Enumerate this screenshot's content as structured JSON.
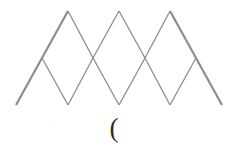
{
  "figure": {
    "name": "triangular-lattice-trapezoid",
    "caption_symbol": "(",
    "faint_artifact": "..",
    "canvas": {
      "width": 238,
      "height": 150,
      "background": "#ffffff"
    },
    "stroke": {
      "color": "#8d8d8d",
      "outline_width": 2.2,
      "inner_width": 1.3
    },
    "geometry": {
      "unit": 51,
      "row_height": 47,
      "rows": [
        {
          "name": "top-edge",
          "y": 11,
          "x_start": 68,
          "x_end": 170,
          "nodes": [
            68,
            119,
            170
          ]
        },
        {
          "name": "middle-edge",
          "y": 58,
          "x_start": 42,
          "x_end": 196,
          "nodes": [
            42,
            93,
            145,
            196
          ]
        },
        {
          "name": "bottom-edge",
          "y": 105,
          "x_start": 16,
          "x_end": 222,
          "nodes": [
            16,
            68,
            119,
            170,
            222
          ]
        }
      ]
    },
    "outline_points": "68,11 170,11 222,105 16,105",
    "horizontal_lines": [
      {
        "name": "top-edge-line",
        "x1": 68,
        "y1": 11,
        "x2": 170,
        "y2": 11,
        "weight": "outline"
      },
      {
        "name": "middle-edge-line",
        "x1": 42,
        "y1": 58,
        "x2": 196,
        "y2": 58,
        "weight": "inner"
      },
      {
        "name": "bottom-edge-line",
        "x1": 16,
        "y1": 105,
        "x2": 222,
        "y2": 105,
        "weight": "outline"
      }
    ],
    "slant_lines": [
      {
        "name": "left-outline-upper",
        "x1": 68,
        "y1": 11,
        "x2": 42,
        "y2": 58,
        "weight": "outline"
      },
      {
        "name": "left-outline-lower",
        "x1": 42,
        "y1": 58,
        "x2": 16,
        "y2": 105,
        "weight": "outline"
      },
      {
        "name": "right-outline-upper",
        "x1": 170,
        "y1": 11,
        "x2": 196,
        "y2": 58,
        "weight": "outline"
      },
      {
        "name": "right-outline-lower",
        "x1": 196,
        "y1": 58,
        "x2": 222,
        "y2": 105,
        "weight": "outline"
      },
      {
        "name": "row1-down-a",
        "x1": 68,
        "y1": 11,
        "x2": 93,
        "y2": 58,
        "weight": "inner"
      },
      {
        "name": "row1-down-b",
        "x1": 119,
        "y1": 11,
        "x2": 145,
        "y2": 58,
        "weight": "inner"
      },
      {
        "name": "row1-up-a",
        "x1": 119,
        "y1": 11,
        "x2": 93,
        "y2": 58,
        "weight": "inner"
      },
      {
        "name": "row1-up-b",
        "x1": 170,
        "y1": 11,
        "x2": 145,
        "y2": 58,
        "weight": "inner"
      },
      {
        "name": "row2-down-a",
        "x1": 42,
        "y1": 58,
        "x2": 68,
        "y2": 105,
        "weight": "inner"
      },
      {
        "name": "row2-down-b",
        "x1": 93,
        "y1": 58,
        "x2": 119,
        "y2": 105,
        "weight": "inner"
      },
      {
        "name": "row2-down-c",
        "x1": 145,
        "y1": 58,
        "x2": 170,
        "y2": 105,
        "weight": "inner"
      },
      {
        "name": "row2-up-a",
        "x1": 93,
        "y1": 58,
        "x2": 68,
        "y2": 105,
        "weight": "inner"
      },
      {
        "name": "row2-up-b",
        "x1": 145,
        "y1": 58,
        "x2": 119,
        "y2": 105,
        "weight": "inner"
      },
      {
        "name": "row2-up-c",
        "x1": 196,
        "y1": 58,
        "x2": 170,
        "y2": 105,
        "weight": "inner"
      }
    ]
  }
}
